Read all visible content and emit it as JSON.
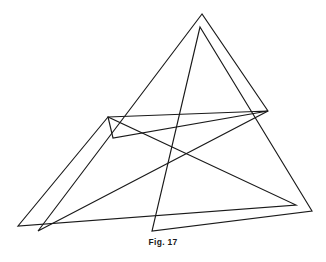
{
  "figure": {
    "caption": "Fig. 17",
    "caption_name": "figure-caption",
    "stroke_color": "#1a1a1a",
    "background_color": "#ffffff",
    "stroke_width": 1.15,
    "width": 326,
    "height": 262,
    "shapes": [
      {
        "name": "triangle-large-left",
        "points": "108,117 18,226 296,205"
      },
      {
        "name": "triangle-large-upper",
        "points": "202,14 38,231 268,111"
      },
      {
        "name": "triangle-tall-right",
        "points": "200,27 152,231 312,211"
      },
      {
        "name": "triangle-thin-band",
        "points": "108,117 268,111 113,138"
      }
    ]
  }
}
